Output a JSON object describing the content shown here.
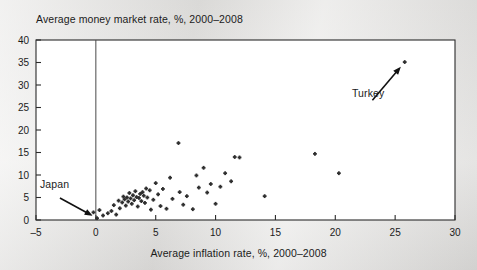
{
  "chart_data": {
    "type": "scatter",
    "title": "Average money market rate, %, 2000–2008",
    "xlabel": "Average inflation rate, %, 2000–2008",
    "ylabel": "Average money market rate, %, 2000–2008",
    "xlim": [
      -5,
      30
    ],
    "ylim": [
      0,
      40
    ],
    "xticks": [
      "-5",
      "0",
      "5",
      "10",
      "15",
      "20",
      "25",
      "30"
    ],
    "xtick_values": [
      -5,
      0,
      5,
      10,
      15,
      20,
      25,
      30
    ],
    "yticks": [
      "0",
      "5",
      "10",
      "15",
      "20",
      "25",
      "30",
      "35",
      "40"
    ],
    "ytick_values": [
      0,
      5,
      10,
      15,
      20,
      25,
      30,
      35,
      40
    ],
    "grid": false,
    "legend": "none",
    "marker_color": "#2e2e2e",
    "reference_line_x": 0,
    "annotations": [
      {
        "label": "Japan",
        "point": [
          0.1,
          0.4
        ],
        "text_xy": [
          -4.5,
          5.6
        ]
      },
      {
        "label": "Turkey",
        "point": [
          25.8,
          35.1
        ],
        "text_xy": [
          21.5,
          26.0
        ]
      }
    ],
    "points": [
      [
        0.1,
        0.4
      ],
      [
        -0.2,
        1.7
      ],
      [
        0.3,
        2.2
      ],
      [
        0.6,
        1.0
      ],
      [
        1.0,
        1.5
      ],
      [
        1.3,
        2.0
      ],
      [
        1.5,
        3.3
      ],
      [
        1.7,
        1.2
      ],
      [
        1.9,
        4.3
      ],
      [
        2.0,
        2.6
      ],
      [
        2.2,
        3.9
      ],
      [
        2.3,
        5.2
      ],
      [
        2.4,
        4.6
      ],
      [
        2.5,
        3.2
      ],
      [
        2.6,
        5.0
      ],
      [
        2.7,
        4.1
      ],
      [
        2.8,
        6.0
      ],
      [
        2.9,
        4.8
      ],
      [
        3.0,
        3.6
      ],
      [
        3.1,
        5.5
      ],
      [
        3.2,
        4.4
      ],
      [
        3.3,
        6.4
      ],
      [
        3.4,
        5.1
      ],
      [
        3.5,
        3.0
      ],
      [
        3.6,
        4.9
      ],
      [
        3.7,
        5.8
      ],
      [
        3.8,
        4.2
      ],
      [
        3.9,
        6.2
      ],
      [
        4.0,
        5.4
      ],
      [
        4.1,
        3.8
      ],
      [
        4.2,
        7.0
      ],
      [
        4.3,
        5.0
      ],
      [
        4.5,
        6.6
      ],
      [
        4.6,
        2.3
      ],
      [
        4.8,
        4.5
      ],
      [
        5.0,
        8.2
      ],
      [
        5.2,
        5.7
      ],
      [
        5.4,
        3.1
      ],
      [
        5.6,
        6.9
      ],
      [
        5.9,
        2.5
      ],
      [
        6.2,
        9.4
      ],
      [
        6.4,
        4.7
      ],
      [
        6.9,
        17.1
      ],
      [
        7.0,
        6.2
      ],
      [
        7.3,
        3.4
      ],
      [
        7.6,
        5.3
      ],
      [
        8.1,
        2.4
      ],
      [
        8.4,
        9.9
      ],
      [
        8.6,
        7.2
      ],
      [
        9.0,
        11.6
      ],
      [
        9.3,
        6.1
      ],
      [
        9.6,
        8.0
      ],
      [
        10.0,
        3.6
      ],
      [
        10.4,
        7.4
      ],
      [
        10.8,
        10.4
      ],
      [
        11.3,
        8.6
      ],
      [
        11.6,
        14.0
      ],
      [
        12.0,
        13.9
      ],
      [
        14.1,
        5.3
      ],
      [
        18.3,
        14.7
      ],
      [
        20.3,
        10.4
      ],
      [
        25.8,
        35.1
      ]
    ]
  }
}
